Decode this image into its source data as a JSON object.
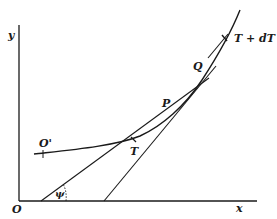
{
  "diagram": {
    "type": "geometry",
    "colors": {
      "ink": "#1a1a1a",
      "background": "#ffffff"
    },
    "axes": {
      "x_label": "x",
      "y_label": "y",
      "origin_label": "O"
    },
    "points": {
      "curve_start": "O'",
      "point_t": "T",
      "point_p": "P",
      "point_q": "Q",
      "point_t_dt": "T + dT"
    },
    "angle_label": "ψ"
  }
}
